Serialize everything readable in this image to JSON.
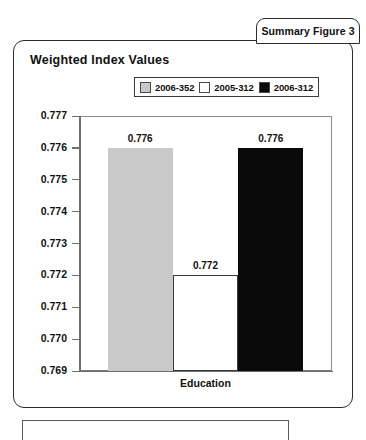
{
  "tab": {
    "label": "Summary Figure 3"
  },
  "card": {
    "title": "Weighted Index Values"
  },
  "chart_data": {
    "type": "bar",
    "title": "Weighted Index Values",
    "xlabel": "Education",
    "ylabel": "",
    "categories": [
      "Education"
    ],
    "series": [
      {
        "name": "2006-352",
        "values": [
          0.776
        ],
        "color": "#c9c9c9"
      },
      {
        "name": "2005-312",
        "values": [
          0.772
        ],
        "color": "#ffffff"
      },
      {
        "name": "2006-312",
        "values": [
          0.776
        ],
        "color": "#0a0a0a"
      }
    ],
    "ylim": [
      0.769,
      0.777
    ],
    "ytick_labels": [
      "0.777",
      "0.776",
      "0.775",
      "0.774",
      "0.773",
      "0.772",
      "0.771",
      "0.770",
      "0.769"
    ],
    "ytick_values": [
      0.777,
      0.776,
      0.775,
      0.774,
      0.773,
      0.772,
      0.771,
      0.77,
      0.769
    ],
    "data_labels": [
      "0.776",
      "0.772",
      "0.776"
    ],
    "grid": false,
    "legend_position": "top"
  },
  "legend": {
    "items": [
      {
        "label": "2006-352",
        "swatch": "#c9c9c9"
      },
      {
        "label": "2005-312",
        "swatch": "#ffffff"
      },
      {
        "label": "2006-312",
        "swatch": "#0a0a0a"
      }
    ]
  }
}
